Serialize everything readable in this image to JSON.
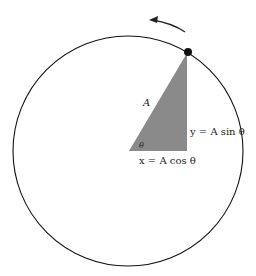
{
  "diagram": {
    "labels": {
      "hypotenuse": "A",
      "angle": "θ",
      "vertical_eq": "y = A sin θ",
      "horizontal_eq": "x = A cos θ"
    },
    "elements": {
      "circle": "circle",
      "triangle_fill": "#8a8a8a",
      "point": "particle",
      "arrow": "counterclockwise"
    },
    "colors": {
      "stroke": "#111111",
      "triangle": "#8a8a8a",
      "background": "#ffffff"
    }
  }
}
